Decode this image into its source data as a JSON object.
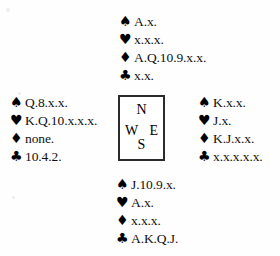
{
  "diagram": {
    "type": "bridge-deal",
    "suit_glyphs": {
      "spades": "♠",
      "hearts": "♥",
      "diamonds": "♦",
      "clubs": "♣"
    },
    "compass": {
      "north": "N",
      "west": "W",
      "east": "E",
      "south": "S"
    },
    "hands": {
      "north": {
        "spades": "A.x.",
        "hearts": "x.x.x.",
        "diamonds": "A.Q.10.9.x.x.",
        "clubs": "x.x."
      },
      "west": {
        "spades": "Q.8.x.x.",
        "hearts": "K.Q.10.x.x.x.",
        "diamonds": "none.",
        "clubs": "10.4.2."
      },
      "east": {
        "spades": "K.x.x.",
        "hearts": "J.x.",
        "diamonds": "K.J.x.x.",
        "clubs": "x.x.x.x.x."
      },
      "south": {
        "spades": "J.10.9.x.",
        "hearts": "A.x.",
        "diamonds": "x.x.x.",
        "clubs": "A.K.Q.J."
      }
    }
  }
}
